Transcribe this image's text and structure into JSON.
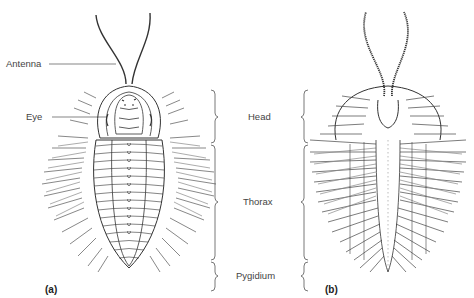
{
  "figure": {
    "labels": {
      "antenna": "Antenna",
      "eye": "Eye",
      "head": "Head",
      "thorax": "Thorax",
      "pygidium": "Pygidium"
    },
    "panels": {
      "a": "(a)",
      "b": "(b)"
    },
    "views": {
      "a": "dorsal-view",
      "b": "ventral-view"
    },
    "colors": {
      "line": "#333333",
      "shade": "#777777",
      "background": "#ffffff"
    }
  }
}
